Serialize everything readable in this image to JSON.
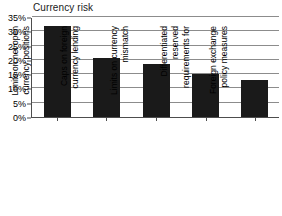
{
  "chart_data": {
    "type": "bar",
    "title": "Currency risk",
    "xlabel": "",
    "ylabel": "",
    "ylim": [
      0,
      35
    ],
    "grid": true,
    "legend": "none",
    "orientation": "vertical",
    "value_suffix": "%",
    "categories": [
      "Limits on net open currency positions",
      "Caps on foreign currency lending",
      "Limits on currency mismatch",
      "Differentiated reserved requirements for",
      "Foreign exchange policy measures"
    ],
    "category_lines": [
      [
        "Limits on net open",
        "currency positions"
      ],
      [
        "Caps on foreign",
        "currency lending"
      ],
      [
        "Limits on currency",
        "mismatch"
      ],
      [
        "Differentiated",
        "reserved",
        "requirements for"
      ],
      [
        "Foreign exchange",
        "policy measures"
      ]
    ],
    "values": [
      32.0,
      20.5,
      18.7,
      15.0,
      13.0
    ],
    "y_ticks": [
      0,
      5,
      10,
      15,
      20,
      25,
      30,
      35
    ],
    "y_tick_labels": [
      "0%",
      "5%",
      "10%",
      "15%",
      "20%",
      "25%",
      "30%",
      "35%"
    ],
    "bar_color": "#1a1a1a",
    "gridline_color": "#8c8c8c",
    "axis_color": "#4d4d4d",
    "background_color": "#ffffff"
  }
}
